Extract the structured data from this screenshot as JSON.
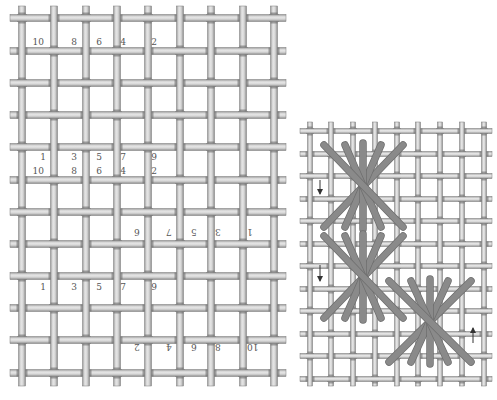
{
  "left_diagram": {
    "label": "Thread numbering sequence on canvas",
    "grid": {
      "verticals_x": [
        22,
        54,
        86,
        117,
        148,
        180,
        211,
        243,
        274
      ],
      "horizontals_y": [
        18,
        51,
        83,
        115,
        147,
        180,
        212,
        244,
        276,
        308,
        340,
        373
      ],
      "x_min": 10,
      "x_max": 286,
      "y_min": 6,
      "y_max": 386,
      "thread_width": 7
    },
    "number_rows": [
      {
        "y": 45,
        "rotated": false,
        "items": [
          {
            "t": "10",
            "x": 44
          },
          {
            "t": "8",
            "x": 77
          },
          {
            "t": "6",
            "x": 102
          },
          {
            "t": "4",
            "x": 126
          },
          {
            "t": "2",
            "x": 157
          }
        ]
      },
      {
        "y": 160,
        "rotated": false,
        "items": [
          {
            "t": "1",
            "x": 46
          },
          {
            "t": "3",
            "x": 77
          },
          {
            "t": "5",
            "x": 102
          },
          {
            "t": "7",
            "x": 126
          },
          {
            "t": "9",
            "x": 157
          }
        ]
      },
      {
        "y": 174,
        "rotated": false,
        "items": [
          {
            "t": "10",
            "x": 44
          },
          {
            "t": "8",
            "x": 77
          },
          {
            "t": "6",
            "x": 102
          },
          {
            "t": "4",
            "x": 126
          },
          {
            "t": "2",
            "x": 157
          }
        ]
      },
      {
        "y": 235,
        "rotated": true,
        "items": [
          {
            "t": "6",
            "x": 140
          },
          {
            "t": "7",
            "x": 172
          },
          {
            "t": "5",
            "x": 197
          },
          {
            "t": "3",
            "x": 221
          },
          {
            "t": "1",
            "x": 253
          }
        ]
      },
      {
        "y": 290,
        "rotated": false,
        "items": [
          {
            "t": "1",
            "x": 46
          },
          {
            "t": "3",
            "x": 77
          },
          {
            "t": "5",
            "x": 102
          },
          {
            "t": "7",
            "x": 126
          },
          {
            "t": "9",
            "x": 157
          }
        ]
      },
      {
        "y": 350,
        "rotated": true,
        "items": [
          {
            "t": "2",
            "x": 140
          },
          {
            "t": "4",
            "x": 172
          },
          {
            "t": "6",
            "x": 197
          },
          {
            "t": "8",
            "x": 221
          },
          {
            "t": "10",
            "x": 253
          }
        ]
      }
    ]
  },
  "right_diagram": {
    "label": "Worked star stitches with direction arrows",
    "grid": {
      "verticals_x": [
        310,
        331,
        353,
        375,
        397,
        418,
        440,
        462,
        484
      ],
      "horizontals_y": [
        131,
        154,
        176,
        199,
        221,
        244,
        266,
        289,
        311,
        334,
        356,
        379
      ],
      "x_min": 300,
      "x_max": 492,
      "y_min": 122,
      "y_max": 386,
      "thread_width": 5
    },
    "stitch_color": "#8a8a8a",
    "stitch_stroke": "#6e6e6e",
    "stars": [
      {
        "name": "star-top",
        "tops": [
          [
            324,
            145
          ],
          [
            345,
            145
          ],
          [
            363,
            143
          ],
          [
            381,
            145
          ],
          [
            403,
            145
          ]
        ],
        "bottoms": [
          [
            324,
            227
          ],
          [
            345,
            227
          ],
          [
            363,
            229
          ],
          [
            381,
            227
          ],
          [
            403,
            227
          ]
        ]
      },
      {
        "name": "star-middle",
        "tops": [
          [
            324,
            236
          ],
          [
            345,
            236
          ],
          [
            363,
            234
          ],
          [
            381,
            236
          ],
          [
            403,
            236
          ]
        ],
        "bottoms": [
          [
            324,
            318
          ],
          [
            345,
            318
          ],
          [
            363,
            320
          ],
          [
            381,
            318
          ],
          [
            403,
            318
          ]
        ]
      },
      {
        "name": "star-bottom",
        "tops": [
          [
            389,
            281
          ],
          [
            411,
            281
          ],
          [
            430,
            279
          ],
          [
            448,
            281
          ],
          [
            471,
            281
          ]
        ],
        "bottoms": [
          [
            389,
            362
          ],
          [
            411,
            362
          ],
          [
            430,
            364
          ],
          [
            448,
            362
          ],
          [
            471,
            362
          ]
        ]
      }
    ],
    "arrows": [
      {
        "name": "arrow-down-1",
        "x": 320,
        "y1": 180,
        "y2": 194,
        "dir": "down"
      },
      {
        "name": "arrow-down-2",
        "x": 320,
        "y1": 265,
        "y2": 281,
        "dir": "down"
      },
      {
        "name": "arrow-up",
        "x": 473,
        "y1": 343,
        "y2": 328,
        "dir": "up"
      }
    ]
  }
}
